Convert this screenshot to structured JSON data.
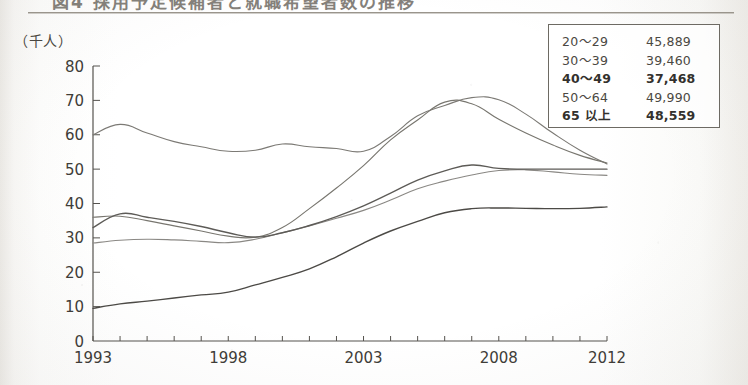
{
  "document": {
    "title_fragment": "図4  採用予定候補者と就職希望者数の推移",
    "unit_label": "（千人）"
  },
  "legend": {
    "rows": [
      {
        "label": "20〜29",
        "value": "45,889"
      },
      {
        "label": "30〜39",
        "value": "39,460"
      },
      {
        "label": "40〜49",
        "value": "37,468"
      },
      {
        "label": "50〜64",
        "value": "49,990"
      },
      {
        "label": "65 以上",
        "value": "48,559"
      }
    ]
  },
  "axis": {
    "y_ticks": [
      "0",
      "10",
      "20",
      "30",
      "40",
      "50",
      "60",
      "70",
      "80"
    ],
    "x_ticks": [
      "1993",
      "1998",
      "2003",
      "2008",
      "2012"
    ]
  },
  "chart_data": {
    "type": "line",
    "title": "図4  採用予定候補者と就職希望者数の推移",
    "xlabel": "",
    "ylabel": "（千人）",
    "ylim": [
      0,
      80
    ],
    "xlim": [
      1993,
      2012
    ],
    "grid": false,
    "legend_position": "top-right",
    "x": [
      1993,
      1994,
      1995,
      1996,
      1997,
      1998,
      1999,
      2000,
      2001,
      2002,
      2003,
      2004,
      2005,
      2006,
      2007,
      2008,
      2009,
      2010,
      2011,
      2012
    ],
    "series": [
      {
        "name": "20〜29",
        "legend_value": "45,889",
        "color": "#7c7a75",
        "values": [
          60.0,
          63.0,
          60.5,
          58.0,
          56.5,
          55.2,
          55.5,
          57.3,
          56.5,
          56.0,
          55.2,
          59.5,
          65.5,
          68.5,
          70.8,
          70.2,
          66.0,
          60.5,
          55.5,
          51.5
        ]
      },
      {
        "name": "30〜39",
        "legend_value": "39,460",
        "color": "#8a8884",
        "values": [
          28.5,
          29.3,
          29.6,
          29.4,
          29.0,
          28.6,
          29.6,
          31.5,
          33.5,
          35.7,
          38.0,
          41.0,
          44.3,
          46.5,
          48.3,
          49.6,
          49.8,
          49.2,
          48.5,
          48.2
        ]
      },
      {
        "name": "40〜49",
        "legend_value": "37,468",
        "color": "#78766f",
        "values": [
          36.0,
          36.3,
          35.0,
          33.5,
          32.0,
          30.5,
          30.2,
          33.0,
          38.5,
          44.5,
          51.0,
          58.5,
          64.3,
          69.5,
          69.0,
          64.5,
          60.5,
          57.0,
          54.0,
          51.8
        ]
      },
      {
        "name": "50〜64",
        "legend_value": "49,990",
        "color": "#5d5b57",
        "values": [
          33.0,
          37.0,
          36.0,
          34.8,
          33.3,
          31.5,
          30.2,
          31.5,
          33.6,
          36.2,
          39.3,
          43.0,
          46.8,
          49.5,
          51.2,
          50.2,
          50.0,
          50.0,
          50.0,
          50.0
        ]
      },
      {
        "name": "65 以上",
        "legend_value": "48,559",
        "color": "#4c4a46",
        "values": [
          9.5,
          10.8,
          11.6,
          12.5,
          13.4,
          14.2,
          16.3,
          18.5,
          21.0,
          24.5,
          28.5,
          32.0,
          34.8,
          37.3,
          38.5,
          38.7,
          38.6,
          38.5,
          38.6,
          39.0
        ]
      }
    ]
  }
}
